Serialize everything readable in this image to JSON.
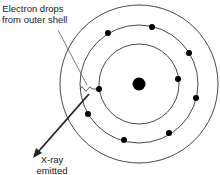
{
  "labels": {
    "electron_drop_line1": "Electron drops",
    "electron_drop_line2": "from outer shell",
    "xray_line1": "X-ray",
    "xray_line2": "emitted"
  },
  "atom": {
    "center": [
      139,
      84
    ],
    "nucleus_radius": 6,
    "shells": [
      {
        "name": "inner",
        "radius": 40,
        "electrons": [
          [
            99,
            89
          ],
          [
            178,
            79
          ]
        ]
      },
      {
        "name": "middle",
        "radius": 59,
        "electrons": [
          [
            108,
            33
          ],
          [
            152,
            27
          ],
          [
            189,
            53
          ],
          [
            196,
            98
          ],
          [
            88,
            114
          ],
          [
            124,
            140
          ],
          [
            169,
            133
          ]
        ]
      },
      {
        "name": "outer",
        "radius": 79,
        "electrons": []
      }
    ]
  },
  "colors": {
    "line": "#222222",
    "fill": "#000000",
    "text": "#222222"
  }
}
